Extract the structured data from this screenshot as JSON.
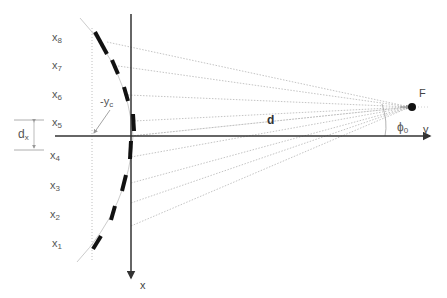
{
  "diagram": {
    "type": "geometry-schematic",
    "colors": {
      "axis": "#333333",
      "segment": "#111111",
      "ray": "#b8b8b8",
      "arc_guide": "#c8c8c8",
      "label": "#555555"
    },
    "labels": {
      "x_axis": "x",
      "y_axis": "y",
      "focus": "F",
      "distance": "d",
      "angle": "ϕ",
      "angle_sub": "0",
      "offset": "-y",
      "offset_sub": "c",
      "spacing": "d",
      "spacing_sub": "x"
    },
    "segments": [
      {
        "label": "x",
        "sub": "8"
      },
      {
        "label": "x",
        "sub": "7"
      },
      {
        "label": "x",
        "sub": "6"
      },
      {
        "label": "x",
        "sub": "5"
      },
      {
        "label": "x",
        "sub": "4"
      },
      {
        "label": "x",
        "sub": "3"
      },
      {
        "label": "x",
        "sub": "2"
      },
      {
        "label": "x",
        "sub": "1"
      }
    ]
  }
}
